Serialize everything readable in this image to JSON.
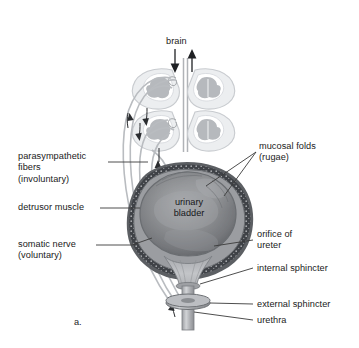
{
  "figure": {
    "panel_label": "a.",
    "background_color": "#ffffff",
    "text_color": "#1a1a1a",
    "leader_line_color": "#3a3a3a"
  },
  "labels": {
    "brain": "brain",
    "parasympathetic": "parasympathetic\nfibers\n(involuntary)",
    "detrusor": "detrusor muscle",
    "somatic": "somatic nerve\n(voluntary)",
    "mucosal": "mucosal folds\n(rugae)",
    "orifice": "orifice of\nureter",
    "internal_sphincter": "internal sphincter",
    "external_sphincter": "external sphincter",
    "urethra": "urethra",
    "organ": "urinary\nbladder"
  },
  "icons": {
    "arrow_down": "arrow-down-icon",
    "arrow_up": "arrow-up-icon",
    "spinal_cord": "spinal-cord-cross-section-icon"
  },
  "colors": {
    "bladder_interior": "#8d8f92",
    "bladder_wall": "#43464b",
    "nerve": "#b9bcc0",
    "spinal_gray": "#b3b6ba",
    "spinal_outline": "#cfd2d6"
  }
}
